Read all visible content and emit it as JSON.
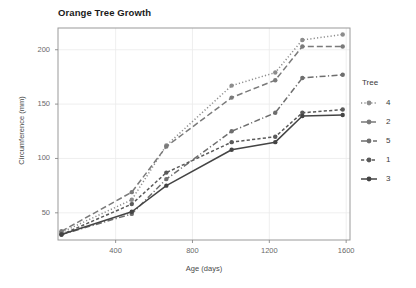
{
  "chart_data": {
    "type": "line",
    "title": "Orange Tree Growth",
    "xlabel": "Age (days)",
    "ylabel": "Circumference (mm)",
    "xlim": [
      100,
      1620
    ],
    "ylim": [
      25,
      220
    ],
    "xticks": [
      400,
      800,
      1200,
      1600
    ],
    "xtick_labels": [
      "400",
      "800",
      "1200",
      "1600"
    ],
    "yticks": [
      50,
      100,
      150,
      200
    ],
    "ytick_labels": [
      "50",
      "100",
      "150",
      "200"
    ],
    "grid": true,
    "legend_position": "right",
    "legend_title": "Tree",
    "x": [
      118,
      484,
      664,
      1004,
      1231,
      1372,
      1582
    ],
    "series": [
      {
        "name": "4",
        "label": "4",
        "linestyle": "dotted",
        "color": "#8c8c8c",
        "values": [
          32,
          62,
          112,
          167,
          179,
          209,
          214
        ]
      },
      {
        "name": "2",
        "label": "2",
        "linestyle": "longdash",
        "color": "#7a7a7a",
        "values": [
          33,
          69,
          111,
          156,
          172,
          203,
          203
        ]
      },
      {
        "name": "5",
        "label": "5",
        "linestyle": "dashdot",
        "color": "#6e6e6e",
        "values": [
          30,
          49,
          81,
          125,
          142,
          174,
          177
        ]
      },
      {
        "name": "1",
        "label": "1",
        "linestyle": "dashed",
        "color": "#5a5a5a",
        "values": [
          30,
          58,
          87,
          115,
          120,
          142,
          145
        ]
      },
      {
        "name": "3",
        "label": "3",
        "linestyle": "solid",
        "color": "#444444",
        "values": [
          30,
          51,
          75,
          108,
          115,
          139,
          140
        ]
      }
    ]
  },
  "panel": {
    "bg": "#ffffff",
    "border_color": "#9a9a9a",
    "grid_color": "#ebebeb"
  }
}
